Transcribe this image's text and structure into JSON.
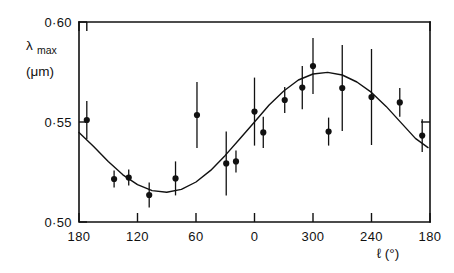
{
  "figure": {
    "background": "#ffffff",
    "ink_color": "#111111"
  },
  "labels": {
    "y_axis_symbol": "λ",
    "y_axis_subscript": "max",
    "y_axis_units": "(μm)",
    "x_axis_title": "ℓ (°)"
  },
  "chart_data": {
    "type": "scatter",
    "title": "",
    "xlabel": "ℓ (°)",
    "ylabel": "λmax (μm)",
    "grid": false,
    "legend": null,
    "xlim": [
      180,
      -180
    ],
    "ylim": [
      0.5,
      0.6
    ],
    "x_tick_labels": [
      "180",
      "120",
      "60",
      "0",
      "300",
      "240",
      "180"
    ],
    "x_tick_values": [
      180,
      120,
      60,
      0,
      -60,
      -120,
      -180
    ],
    "y_tick_labels": [
      "0·60",
      "0·55",
      "0·50"
    ],
    "y_tick_values": [
      0.6,
      0.55,
      0.5
    ],
    "y_right_tick_values": [
      0.55
    ],
    "errorbars": "vertical",
    "points": [
      {
        "x": 172,
        "y": 0.551,
        "yerr": 0.0095
      },
      {
        "x": 144,
        "y": 0.5215,
        "yerr": 0.0042
      },
      {
        "x": 129,
        "y": 0.5222,
        "yerr": 0.004
      },
      {
        "x": 108,
        "y": 0.5135,
        "yerr": 0.0063
      },
      {
        "x": 81,
        "y": 0.5218,
        "yerr": 0.0085
      },
      {
        "x": 59,
        "y": 0.5535,
        "yerr": 0.0165
      },
      {
        "x": 29,
        "y": 0.5293,
        "yerr": 0.016
      },
      {
        "x": 19,
        "y": 0.5303,
        "yerr": 0.0055
      },
      {
        "x": 0,
        "y": 0.5552,
        "yerr": 0.017
      },
      {
        "x": -9,
        "y": 0.5448,
        "yerr": 0.0078
      },
      {
        "x": -31,
        "y": 0.561,
        "yerr": 0.0065
      },
      {
        "x": -49,
        "y": 0.5672,
        "yerr": 0.0108
      },
      {
        "x": -60,
        "y": 0.578,
        "yerr": 0.014
      },
      {
        "x": -76,
        "y": 0.5452,
        "yerr": 0.007
      },
      {
        "x": -90,
        "y": 0.567,
        "yerr": 0.0215
      },
      {
        "x": -120,
        "y": 0.5625,
        "yerr": 0.024
      },
      {
        "x": -149,
        "y": 0.5598,
        "yerr": 0.0072
      },
      {
        "x": -172,
        "y": 0.5432,
        "yerr": 0.0082
      }
    ],
    "fit_curve": {
      "form": "sinusoid",
      "mean": 0.5445,
      "amplitude": 0.0285,
      "phase_deg_of_max": -98,
      "description": "smooth sinusoidal fit through the data, minimum near ℓ=105° and maximum near ℓ=262°"
    },
    "fit_samples_y": [
      0.5448,
      0.5378,
      0.5302,
      0.5236,
      0.5187,
      0.5157,
      0.5149,
      0.5163,
      0.52,
      0.5258,
      0.5333,
      0.5416,
      0.55,
      0.5585,
      0.5655,
      0.571,
      0.574,
      0.5748,
      0.5735,
      0.57,
      0.5648,
      0.5578,
      0.5498,
      0.5418,
      0.5372
    ],
    "fit_samples_x": [
      180,
      165,
      150,
      135,
      120,
      105,
      90,
      75,
      60,
      45,
      30,
      15,
      0,
      -15,
      -30,
      -45,
      -60,
      -75,
      -90,
      -105,
      -120,
      -135,
      -150,
      -165,
      -178
    ]
  }
}
